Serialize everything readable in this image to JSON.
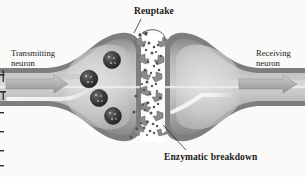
{
  "figure": {
    "kind": "synapse-diagram",
    "title_labels": {
      "reuptake": "Reuptake",
      "enzymatic_breakdown": "Enzymatic breakdown",
      "transmitting_neuron": "Transmitting\nneuron",
      "transmitting_neuron_line1": "Transmitting",
      "transmitting_neuron_line2": "neuron",
      "receiving_neuron_line1": "Receiving",
      "receiving_neuron_line2": "neuron"
    },
    "colors": {
      "background": "#fbfaf8",
      "membrane_dark": "#7d7d7d",
      "membrane_mid": "#9a9a9a",
      "cytoplasm_light": "#c9c9c9",
      "cytoplasm_pale": "#e2e2e2",
      "axon_band": "#b4b4b4",
      "vesicle_dark": "#3a3a3a",
      "neurotransmitter": "#5a5a5a",
      "arrow_fill": "#b0b0b0",
      "text": "#1a1a1a",
      "cleft": "#ffffff"
    },
    "elements": {
      "vesicle_count": 4,
      "receptor_count_presynaptic": 7,
      "receptor_count_postsynaptic": 6,
      "axon_arrow_direction": "right",
      "reuptake_arrow": "curved-right-to-left",
      "neurotransmitter_dot_clusters": 5
    }
  }
}
